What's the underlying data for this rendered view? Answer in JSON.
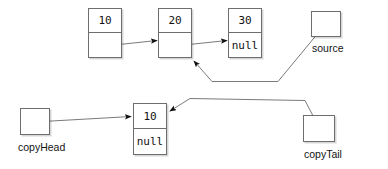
{
  "diagram": {
    "stroke_color": "#6e6e6e",
    "line_color": "#7a7a7a",
    "arrow_color": "#111111",
    "text_color": "#111111",
    "background": "#ffffff",
    "source_list": {
      "nodes": [
        {
          "id": "src-node-1",
          "value": "10",
          "next": ""
        },
        {
          "id": "src-node-2",
          "value": "20",
          "next": ""
        },
        {
          "id": "src-node-3",
          "value": "30",
          "next": "null"
        }
      ]
    },
    "copy_list": {
      "nodes": [
        {
          "id": "copy-node-1",
          "value": "10",
          "next": "null"
        }
      ]
    },
    "pointers": [
      {
        "id": "source",
        "label": "source",
        "target": "src-node-2"
      },
      {
        "id": "copyHead",
        "label": "copyHead",
        "target": "copy-node-1"
      },
      {
        "id": "copyTail",
        "label": "copyTail",
        "target": "copy-node-1"
      }
    ]
  }
}
